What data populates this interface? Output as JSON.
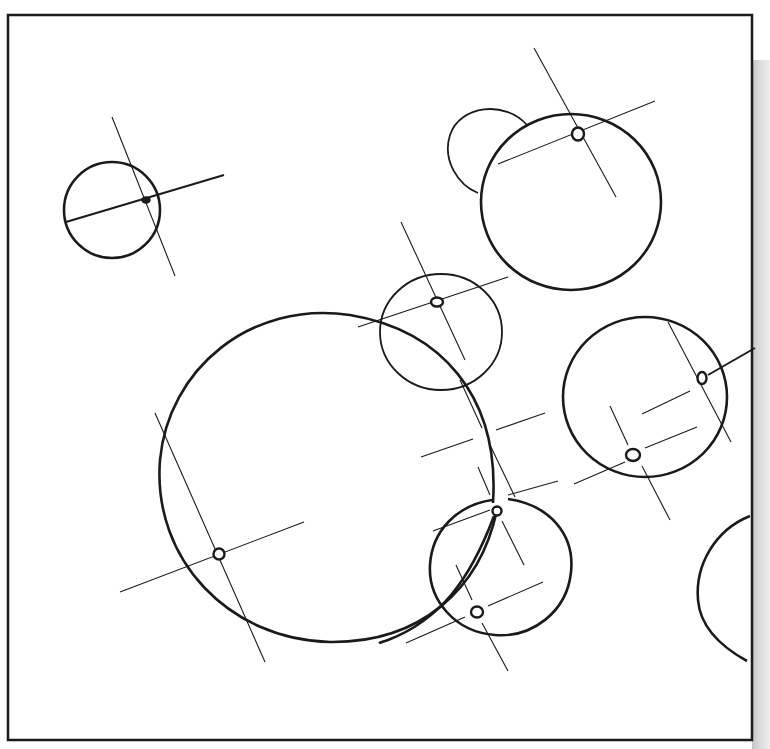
{
  "diagram": {
    "type": "circle-centerline-drawing",
    "frame": {
      "x": 8,
      "y": 15,
      "width": 744,
      "height": 725,
      "stroke": "#1a1a1a"
    },
    "colors": {
      "ink": "#1a1a1a",
      "paper": "#ffffff",
      "scan_shadow": "#c0c0c0"
    },
    "circles": [
      {
        "id": "c1",
        "cx": 112,
        "cy": 210,
        "r": 48,
        "weight": "thick"
      },
      {
        "id": "c2",
        "cx": 571,
        "cy": 202,
        "r": 90,
        "weight": "thick"
      },
      {
        "id": "c3",
        "cx": 441,
        "cy": 332,
        "r": 61,
        "weight": "thin"
      },
      {
        "id": "c4",
        "cx": 330,
        "cy": 478,
        "r": 170,
        "weight": "thick"
      },
      {
        "id": "c5",
        "cx": 645,
        "cy": 400,
        "r": 82,
        "weight": "thick"
      },
      {
        "id": "c6",
        "cx": 500,
        "cy": 566,
        "r": 71,
        "weight": "thick"
      }
    ],
    "arcs": [
      {
        "id": "lobe-top",
        "description": "partial circle behind c2"
      },
      {
        "id": "arc-right",
        "description": "partial arc at right edge"
      },
      {
        "id": "arc-connector",
        "description": "curve linking c6 hub to lower left"
      }
    ],
    "centers": [
      {
        "id": "p1",
        "x": 146,
        "y": 200,
        "style": "filled"
      },
      {
        "id": "p2",
        "x": 578,
        "y": 134,
        "style": "ring"
      },
      {
        "id": "p3",
        "x": 437,
        "y": 302,
        "style": "ring"
      },
      {
        "id": "p4",
        "x": 219,
        "y": 554,
        "style": "ring"
      },
      {
        "id": "p5",
        "x": 702,
        "y": 378,
        "style": "ring"
      },
      {
        "id": "p6",
        "x": 633,
        "y": 455,
        "style": "ring"
      },
      {
        "id": "p7",
        "x": 497,
        "y": 511,
        "style": "ring"
      },
      {
        "id": "p8",
        "x": 477,
        "y": 612,
        "style": "ring"
      }
    ]
  }
}
